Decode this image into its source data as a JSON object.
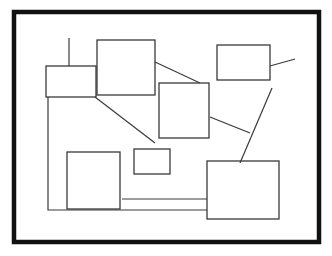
{
  "canvas": {
    "width": 332,
    "height": 256,
    "background_color": "#ffffff",
    "title": "hand-drawn block diagram"
  },
  "frame": {
    "name": "outer-frame",
    "x": 14,
    "y": 12,
    "width": 305,
    "height": 230,
    "stroke_color": "#111111",
    "stroke_width": 4.5,
    "fill": "none"
  },
  "style": {
    "node_stroke_color": "#3a3a3a",
    "node_stroke_width": 1.3,
    "node_fill": "#ffffff",
    "connector_stroke_color": "#3a3a3a",
    "connector_stroke_width": 1.2
  },
  "nodes": [
    {
      "id": "box-left-small",
      "label": "",
      "x": 46,
      "y": 66,
      "width": 50,
      "height": 31
    },
    {
      "id": "box-top-center",
      "label": "",
      "x": 97,
      "y": 40,
      "width": 58,
      "height": 55
    },
    {
      "id": "box-middle-center",
      "label": "",
      "x": 159,
      "y": 83,
      "width": 50,
      "height": 55
    },
    {
      "id": "box-top-right",
      "label": "",
      "x": 217,
      "y": 45,
      "width": 53,
      "height": 35
    },
    {
      "id": "box-bottom-left",
      "label": "",
      "x": 67,
      "y": 152,
      "width": 53,
      "height": 57
    },
    {
      "id": "box-bottom-small",
      "label": "",
      "x": 134,
      "y": 149,
      "width": 36,
      "height": 25
    },
    {
      "id": "box-bottom-right",
      "label": "",
      "x": 207,
      "y": 161,
      "width": 72,
      "height": 58
    }
  ],
  "connectors": [
    {
      "id": "stub-top-vertical",
      "points": "69,38 69,66",
      "description": "short vertical stub rising from top edge of box-left-small"
    },
    {
      "id": "link-left-bus",
      "points": "48,97 48,210 207,210",
      "description": "vertical bus from bottom-left of box-left-small down then right to box-bottom-right"
    },
    {
      "id": "link-left-to-small-diagonal",
      "points": "95,97 155,143",
      "description": "diagonal from bottom-right of box-left-small toward box-bottom-small"
    },
    {
      "id": "link-topcenter-to-middle",
      "points": "155,62 200,83",
      "description": "diagonal from right edge of box-top-center to top-left of box-middle-center"
    },
    {
      "id": "link-middle-to-right-diagonal",
      "points": "210,117 250,133",
      "description": "short diagonal from right edge of box-middle-center to the right"
    },
    {
      "id": "link-topright-tail",
      "points": "270,66 295,59",
      "description": "short tail extending right from box-top-right"
    },
    {
      "id": "link-right-long-diagonal",
      "points": "272,88 240,163",
      "description": "long diagonal from below box-top-right down to top of box-bottom-right"
    },
    {
      "id": "link-bottomleft-to-bottomright",
      "points": "122,199 207,199",
      "description": "horizontal link from box-bottom-left right side to box-bottom-right"
    }
  ]
}
